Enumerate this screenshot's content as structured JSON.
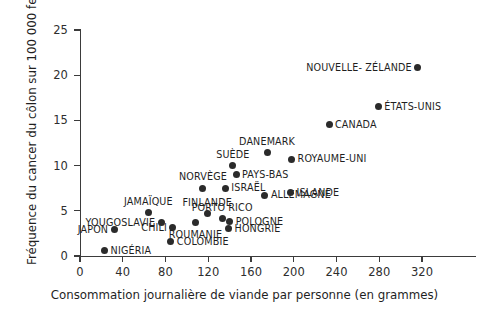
{
  "chart_data": {
    "type": "scatter",
    "title": "",
    "xlabel": "Consommation journalière de viande par personne (en grammes)",
    "ylabel": "Fréquence du cancer du côlon sur 100 000 femmes",
    "xlim": [
      0,
      365
    ],
    "ylim": [
      0,
      25.2
    ],
    "xticks": [
      0,
      40,
      80,
      120,
      160,
      200,
      240,
      280,
      320
    ],
    "yticks": [
      0,
      5,
      10,
      15,
      20,
      25
    ],
    "grid": false,
    "legend": null,
    "marker_color": "#2b2b2b",
    "axis_color": "#3b3b3b",
    "points": [
      {
        "label": "NIGÉRIA",
        "x": 23,
        "y": 0.6,
        "label_pos": "right"
      },
      {
        "label": "COLOMBIE",
        "x": 85,
        "y": 1.6,
        "label_pos": "right"
      },
      {
        "label": "JAPON",
        "x": 32,
        "y": 2.9,
        "label_pos": "left"
      },
      {
        "label": "CHILI",
        "x": 87,
        "y": 3.1,
        "label_pos": "left"
      },
      {
        "label": "HONGRIE",
        "x": 139,
        "y": 3.0,
        "label_pos": "right"
      },
      {
        "label": "YOUGOSLAVIE",
        "x": 76,
        "y": 3.7,
        "label_pos": "left"
      },
      {
        "label": "ROUMANIE",
        "x": 108,
        "y": 3.7,
        "label_pos": "below"
      },
      {
        "label": "POLOGNE",
        "x": 140,
        "y": 3.8,
        "label_pos": "right"
      },
      {
        "label": "PORTO RICO",
        "x": 133,
        "y": 4.1,
        "label_pos": "above"
      },
      {
        "label": "FINLANDE",
        "x": 119,
        "y": 4.7,
        "label_pos": "above"
      },
      {
        "label": "JAMAÏQUE",
        "x": 64,
        "y": 4.8,
        "label_pos": "above"
      },
      {
        "label": "ALLEMAGNE",
        "x": 173,
        "y": 6.7,
        "label_pos": "right"
      },
      {
        "label": "ISLANDE",
        "x": 197,
        "y": 7.0,
        "label_pos": "right"
      },
      {
        "label": "NORVÈGE",
        "x": 115,
        "y": 7.5,
        "label_pos": "above"
      },
      {
        "label": "ISRAËL",
        "x": 136,
        "y": 7.5,
        "label_pos": "right"
      },
      {
        "label": "PAYS-BAS",
        "x": 146,
        "y": 9.0,
        "label_pos": "right"
      },
      {
        "label": "SUÈDE",
        "x": 143,
        "y": 10.0,
        "label_pos": "above"
      },
      {
        "label": "ROYAUME-UNI",
        "x": 198,
        "y": 10.7,
        "label_pos": "right"
      },
      {
        "label": "DANEMARK",
        "x": 175,
        "y": 11.4,
        "label_pos": "above"
      },
      {
        "label": "CANADA",
        "x": 233,
        "y": 14.5,
        "label_pos": "right"
      },
      {
        "label": "ÉTATS-UNIS",
        "x": 279,
        "y": 16.5,
        "label_pos": "right"
      },
      {
        "label": "NOUVELLE- ZÉLANDE",
        "x": 316,
        "y": 20.8,
        "label_pos": "left"
      }
    ]
  }
}
